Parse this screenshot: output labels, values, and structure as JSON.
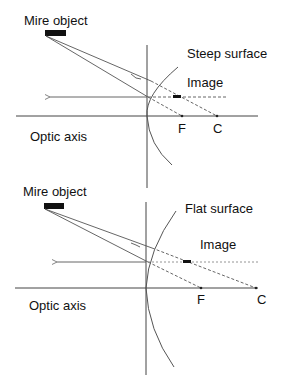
{
  "panels": [
    {
      "id": "steep",
      "object_label": "Mire object",
      "surface_label": "Steep surface",
      "image_label": "Image",
      "axis_label": "Optic axis",
      "focal_label": "F",
      "center_label": "C"
    },
    {
      "id": "flat",
      "object_label": "Mire object",
      "surface_label": "Flat surface",
      "image_label": "Image",
      "axis_label": "Optic axis",
      "focal_label": "F",
      "center_label": "C"
    }
  ],
  "colors": {
    "line": "#444444",
    "text": "#111111",
    "object": "#111111"
  }
}
